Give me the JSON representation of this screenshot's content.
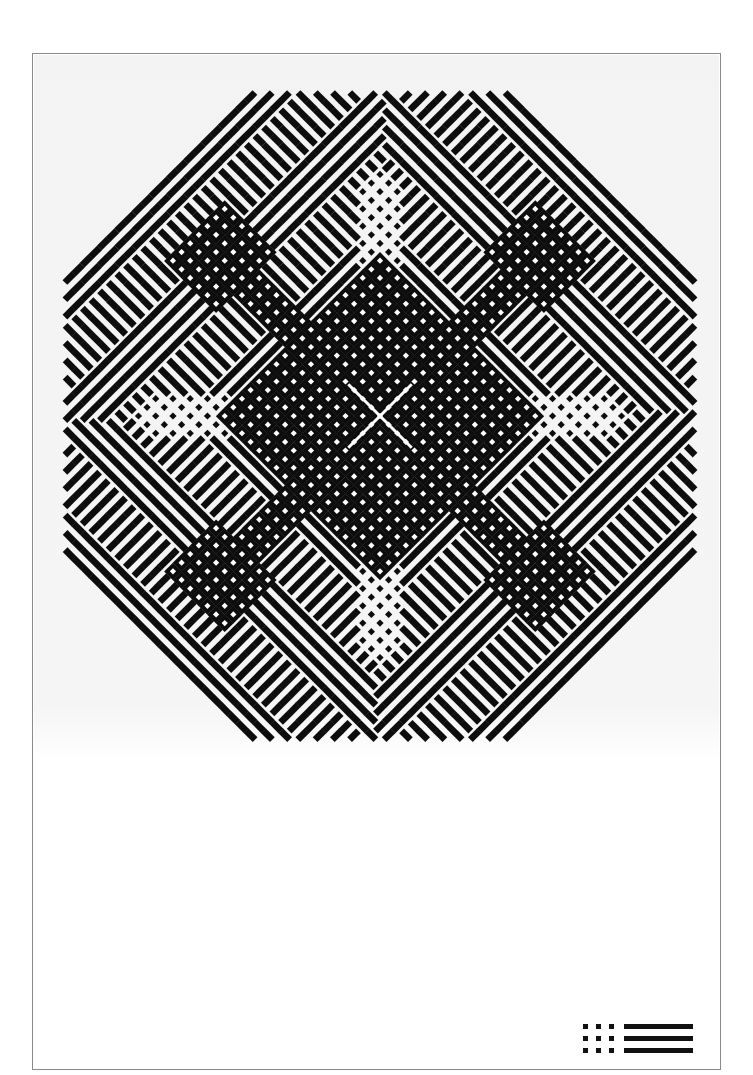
{
  "artwork": {
    "title_visible": "",
    "background": "#f4f4f4",
    "ink": "#0d0d0d",
    "paper": "#ffffff",
    "frame_color": "#8a8a8a",
    "center": [
      380,
      416
    ],
    "cell": 12.2,
    "half_extent": 26,
    "stripe_ratio": 0.55,
    "hole_ratio": 0.36,
    "dot_ratio": 0.42,
    "regions_note": "Woven diagonal pattern with fourfold symmetry: central crossed block with an X, dotted open crosses on axes, crossed corner blocks on diagonals, striped fields elsewhere"
  },
  "logo": {
    "dot_rows": 3,
    "dot_cols": 3,
    "bars": 3
  }
}
